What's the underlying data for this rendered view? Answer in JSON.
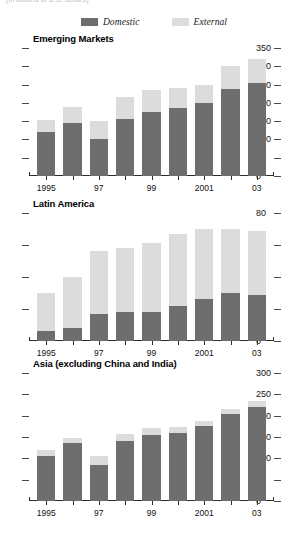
{
  "caption": "(In billions of U.S. dollars)",
  "legend": {
    "items": [
      {
        "label": "Domestic",
        "color": "#6e6e6e",
        "key": "domestic"
      },
      {
        "label": "External",
        "color": "#dcdcdc",
        "key": "external"
      }
    ]
  },
  "colors": {
    "domestic": "#6e6e6e",
    "external": "#dcdcdc",
    "axis": "#2b2b2b",
    "text": "#111111"
  },
  "chart_data": [
    {
      "type": "bar",
      "stacked": true,
      "title": "Emerging Markets",
      "xlabel": "",
      "ylabel": "",
      "ylim": [
        0,
        350
      ],
      "yticks": [
        0,
        50,
        100,
        150,
        200,
        250,
        300,
        350
      ],
      "ytick_labels": [
        "0",
        "50",
        "100",
        "150",
        "200",
        "250",
        "300",
        "350"
      ],
      "axis_position": "right",
      "grid": false,
      "legend_position": "top-center",
      "x": [
        1995,
        1996,
        1997,
        1998,
        1999,
        2000,
        2001,
        2002,
        2003
      ],
      "categories": [
        "1995",
        "1996",
        "1997",
        "1998",
        "1999",
        "2000",
        "2001",
        "2002",
        "2003"
      ],
      "xtick_labels": [
        "1995",
        "",
        "97",
        "",
        "99",
        "",
        "2001",
        "",
        "03"
      ],
      "series": [
        {
          "name": "Domestic",
          "values": [
            120,
            145,
            100,
            155,
            175,
            185,
            200,
            237,
            255
          ]
        },
        {
          "name": "External",
          "values": [
            34,
            45,
            50,
            60,
            59,
            56,
            50,
            63,
            65
          ]
        }
      ],
      "totals": [
        154,
        190,
        150,
        215,
        234,
        241,
        250,
        300,
        320
      ]
    },
    {
      "type": "bar",
      "stacked": true,
      "title": "Latin America",
      "xlabel": "",
      "ylabel": "",
      "ylim": [
        0,
        80
      ],
      "yticks": [
        0,
        20,
        40,
        60,
        80
      ],
      "ytick_labels": [
        "0",
        "20",
        "40",
        "60",
        "80"
      ],
      "axis_position": "right",
      "grid": false,
      "legend_position": "top-center",
      "x": [
        1995,
        1996,
        1997,
        1998,
        1999,
        2000,
        2001,
        2002,
        2003
      ],
      "categories": [
        "1995",
        "1996",
        "1997",
        "1998",
        "1999",
        "2000",
        "2001",
        "2002",
        "2003"
      ],
      "xtick_labels": [
        "1995",
        "",
        "97",
        "",
        "99",
        "",
        "2001",
        "",
        "03"
      ],
      "series": [
        {
          "name": "Domestic",
          "values": [
            6,
            8,
            17,
            18,
            18,
            22,
            26,
            30,
            29
          ]
        },
        {
          "name": "External",
          "values": [
            24,
            32,
            39,
            40,
            43,
            45,
            44,
            40,
            40
          ]
        }
      ],
      "totals": [
        30,
        40,
        56,
        58,
        61,
        67,
        70,
        70,
        69
      ]
    },
    {
      "type": "bar",
      "stacked": true,
      "title": "Asia (excluding China and India)",
      "xlabel": "",
      "ylabel": "",
      "ylim": [
        0,
        300
      ],
      "yticks": [
        0,
        50,
        100,
        150,
        200,
        250,
        300
      ],
      "ytick_labels": [
        "0",
        "50",
        "100",
        "150",
        "200",
        "250",
        "300"
      ],
      "axis_position": "right",
      "grid": false,
      "legend_position": "top-center",
      "x": [
        1995,
        1996,
        1997,
        1998,
        1999,
        2000,
        2001,
        2002,
        2003
      ],
      "categories": [
        "1995",
        "1996",
        "1997",
        "1998",
        "1999",
        "2000",
        "2001",
        "2002",
        "2003"
      ],
      "xtick_labels": [
        "1995",
        "",
        "97",
        "",
        "99",
        "",
        "2001",
        "",
        "03"
      ],
      "series": [
        {
          "name": "Domestic",
          "values": [
            105,
            135,
            85,
            140,
            155,
            160,
            176,
            205,
            220
          ]
        },
        {
          "name": "External",
          "values": [
            15,
            12,
            20,
            16,
            16,
            13,
            12,
            11,
            15
          ]
        }
      ],
      "totals": [
        120,
        147,
        105,
        156,
        171,
        173,
        188,
        216,
        235
      ]
    }
  ]
}
